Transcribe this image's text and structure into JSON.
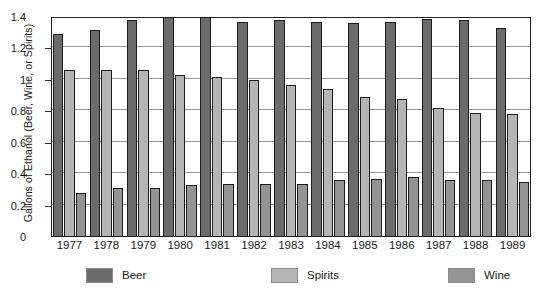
{
  "chart_data": {
    "type": "bar",
    "title": "",
    "xlabel": "",
    "ylabel": "Gallons of Ethanol (Beer, Wine, or Spirits)",
    "categories": [
      "1977",
      "1978",
      "1979",
      "1980",
      "1981",
      "1982",
      "1983",
      "1984",
      "1985",
      "1986",
      "1987",
      "1988",
      "1989"
    ],
    "series": [
      {
        "name": "Beer",
        "color": "#6b6b6b",
        "values": [
          1.29,
          1.32,
          1.38,
          1.4,
          1.4,
          1.37,
          1.38,
          1.37,
          1.36,
          1.37,
          1.39,
          1.38,
          1.33
        ]
      },
      {
        "name": "Spirits",
        "color": "#b5b5b5",
        "values": [
          1.06,
          1.06,
          1.06,
          1.03,
          1.02,
          1.0,
          0.97,
          0.94,
          0.89,
          0.88,
          0.82,
          0.79,
          0.78
        ]
      },
      {
        "name": "Wine",
        "color": "#949494",
        "values": [
          0.28,
          0.31,
          0.31,
          0.33,
          0.34,
          0.34,
          0.34,
          0.36,
          0.37,
          0.38,
          0.36,
          0.36,
          0.35
        ]
      }
    ],
    "ylim": [
      0,
      1.4
    ],
    "yticks": [
      0,
      0.2,
      0.4,
      0.6,
      0.8,
      1,
      1.2,
      1.4
    ],
    "ytick_labels": [
      "0",
      "0.2",
      "0.4",
      "0.6",
      "0.8",
      "1",
      "1.2",
      "1.4"
    ],
    "grid": true,
    "grid_axis": "y",
    "legend_position": "bottom",
    "legend": [
      "Beer",
      "Spirits",
      "Wine"
    ],
    "bar_border_color": "#1d1d1d",
    "plot_border_color": "#222222",
    "gridline_color": "#9a9a9a",
    "background": "#ffffff"
  }
}
